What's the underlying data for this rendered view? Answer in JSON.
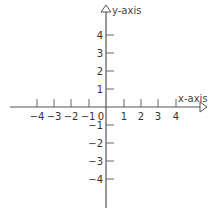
{
  "diagram": {
    "type": "coordinate-plane",
    "x_axis": {
      "label": "x-axis",
      "ticks": [
        {
          "value": -4,
          "label": "−4"
        },
        {
          "value": -3,
          "label": "−3"
        },
        {
          "value": -2,
          "label": "−2"
        },
        {
          "value": -1,
          "label": "−1"
        },
        {
          "value": 1,
          "label": "1"
        },
        {
          "value": 2,
          "label": "2"
        },
        {
          "value": 3,
          "label": "3"
        },
        {
          "value": 4,
          "label": "4"
        }
      ]
    },
    "y_axis": {
      "label": "y-axis",
      "ticks": [
        {
          "value": 4,
          "label": "4"
        },
        {
          "value": 3,
          "label": "3"
        },
        {
          "value": 2,
          "label": "2"
        },
        {
          "value": 1,
          "label": "1"
        },
        {
          "value": -1,
          "label": "−1"
        },
        {
          "value": -2,
          "label": "−2"
        },
        {
          "value": -3,
          "label": "−3"
        },
        {
          "value": -4,
          "label": "−4"
        }
      ]
    },
    "origin_label": "0",
    "colors": {
      "axis": "#555555",
      "text": "#333333",
      "background": "#ffffff"
    }
  }
}
